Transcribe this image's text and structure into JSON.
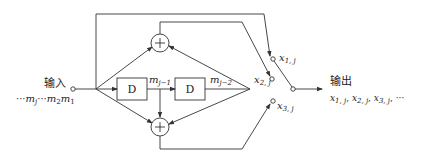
{
  "diagram": {
    "type": "convolutional-encoder-block-diagram",
    "input": {
      "label": "输入",
      "sequence_prefix": "···",
      "sequence": [
        "m_j",
        "···",
        "m_2",
        "m_1"
      ],
      "sequence_text": "···mj···m2m1"
    },
    "output": {
      "label": "输出",
      "sequence_text": "x1,j, x2,j, x3,j, ···"
    },
    "delay_blocks": [
      {
        "label": "D"
      },
      {
        "label": "D"
      }
    ],
    "delay_outputs": [
      {
        "name": "m",
        "sub": "j−1"
      },
      {
        "name": "m",
        "sub": "j−2"
      }
    ],
    "adders": [
      {
        "symbol": "+",
        "position": "upper"
      },
      {
        "symbol": "+",
        "position": "lower"
      }
    ],
    "switch_taps": [
      {
        "name": "x",
        "sub": "1, j"
      },
      {
        "name": "x",
        "sub": "2, j"
      },
      {
        "name": "x",
        "sub": "3, j"
      }
    ],
    "output_sequence": [
      {
        "name": "x",
        "sub": "1, j"
      },
      {
        "name": "x",
        "sub": "2, j"
      },
      {
        "name": "x",
        "sub": "3, j"
      }
    ],
    "ellipsis": "···",
    "separator": ","
  },
  "colors": {
    "line": "#333333",
    "text": "#222222",
    "background": "#ffffff"
  }
}
